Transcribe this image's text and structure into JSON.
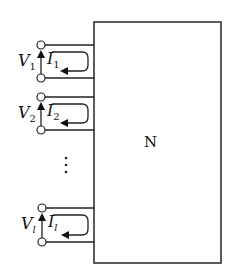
{
  "network": {
    "label": "N",
    "box": {
      "x": 94,
      "y": 22,
      "width": 127,
      "height": 241
    }
  },
  "ports": [
    {
      "voltage": "V",
      "voltage_sub": "1",
      "current": "I",
      "current_sub": "1",
      "top_y": 45,
      "bottom_y": 78,
      "sub_italic": false
    },
    {
      "voltage": "V",
      "voltage_sub": "2",
      "current": "I",
      "current_sub": "2",
      "top_y": 97,
      "bottom_y": 130,
      "sub_italic": false
    },
    {
      "voltage": "V",
      "voltage_sub": "l",
      "current": "I",
      "current_sub": "l",
      "top_y": 208,
      "bottom_y": 241,
      "sub_italic": true
    }
  ],
  "ellipsis": {
    "symbol": "⋮",
    "x": 66,
    "y": [
      158,
      165,
      172
    ]
  },
  "colors": {
    "line": "#222222",
    "background": "#ffffff"
  }
}
